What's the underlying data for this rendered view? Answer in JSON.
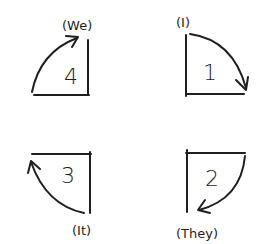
{
  "diagram": {
    "quadrants": [
      {
        "id": "q4",
        "number": "4",
        "label": "(We)",
        "position": "top-left",
        "arrow": "counterclockwise-up"
      },
      {
        "id": "q1",
        "number": "1",
        "label": "(I)",
        "position": "top-right",
        "arrow": "clockwise-down"
      },
      {
        "id": "q3",
        "number": "3",
        "label": "(It)",
        "position": "bottom-left",
        "arrow": "counterclockwise-up"
      },
      {
        "id": "q2",
        "number": "2",
        "label": "(They)",
        "position": "bottom-right",
        "arrow": "clockwise-down"
      }
    ],
    "colors": {
      "ink": "#1e1e1e",
      "background": "#ffffff"
    }
  }
}
